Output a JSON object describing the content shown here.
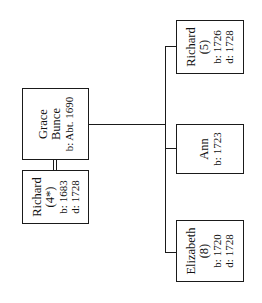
{
  "parents": [
    {
      "name_lines": [
        "Grace",
        "Bunce"
      ],
      "details": [
        "b: Abt. 1690"
      ]
    },
    {
      "name_lines": [
        "Richard",
        "(4*)"
      ],
      "details": [
        "b: 1683",
        "d: 1728"
      ]
    }
  ],
  "children": [
    {
      "name_lines": [
        "Richard",
        "(5)"
      ],
      "details": [
        "b: 1726",
        "d: 1728"
      ]
    },
    {
      "name_lines": [
        "Ann"
      ],
      "details": [
        "b: 1723"
      ]
    },
    {
      "name_lines": [
        "Elizabeth",
        "(8)"
      ],
      "details": [
        "b: 1720",
        "d: 1728"
      ]
    }
  ]
}
